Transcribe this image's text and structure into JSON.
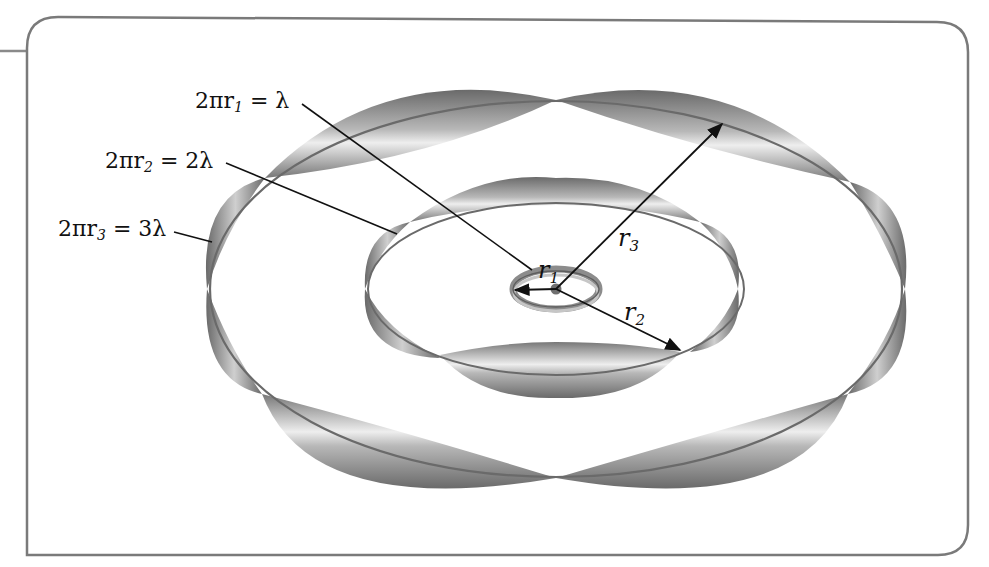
{
  "figure": {
    "type": "standing-wave circular orbits",
    "border_color": "#6e6e6e",
    "ribbon_dark": "#5a5a5a",
    "ribbon_light": "#f2f2f2",
    "line_color": "#111111"
  },
  "orbits": [
    {
      "id": "r1",
      "equation_lhs": "2πr",
      "subscript": "1",
      "equation_rhs": "= λ",
      "radius_label": "r",
      "radius_sub": "1",
      "wavelengths": 1
    },
    {
      "id": "r2",
      "equation_lhs": "2πr",
      "subscript": "2",
      "equation_rhs": "= 2λ",
      "radius_label": "r",
      "radius_sub": "2",
      "wavelengths": 2
    },
    {
      "id": "r3",
      "equation_lhs": "2πr",
      "subscript": "3",
      "equation_rhs": "= 3λ",
      "radius_label": "r",
      "radius_sub": "3",
      "wavelengths": 3
    }
  ]
}
